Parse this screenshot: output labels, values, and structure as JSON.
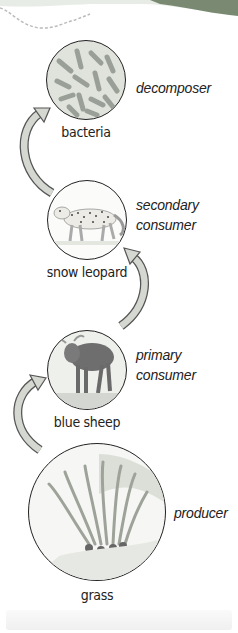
{
  "food_chain": {
    "levels": [
      {
        "organism": "bacteria",
        "role_line1": "decomposer",
        "role_line2": ""
      },
      {
        "organism": "snow leopard",
        "role_line1": "secondary",
        "role_line2": "consumer"
      },
      {
        "organism": "blue sheep",
        "role_line1": "primary",
        "role_line2": "consumer"
      },
      {
        "organism": "grass",
        "role_line1": "producer",
        "role_line2": ""
      }
    ]
  },
  "colors": {
    "arrow_fill": "#d4d8d0",
    "arrow_stroke": "#555555",
    "header_band": "#7a9a6a",
    "circle_border": "#222222"
  },
  "icons": [
    "bacteria-illustration",
    "snow-leopard-illustration",
    "blue-sheep-illustration",
    "grass-illustration",
    "curved-arrow-icon"
  ]
}
